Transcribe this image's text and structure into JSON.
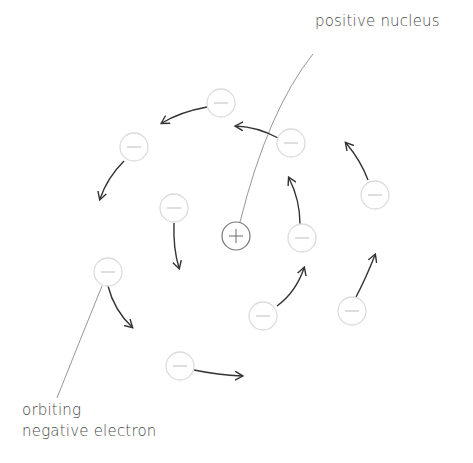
{
  "labels": {
    "nucleus": "positive nucleus",
    "electron_line1": "orbiting",
    "electron_line2": "negative electron"
  },
  "colors": {
    "electron_stroke": "#dcdcdc",
    "electron_sign": "#c8c8c8",
    "nucleus_stroke": "#777777",
    "arrow": "#333333",
    "leader_line": "#8a8a8a",
    "text": "#4a4a4a"
  },
  "nucleus": {
    "x": 236,
    "y": 236,
    "r": 14,
    "sign": "+"
  },
  "electrons": [
    {
      "x": 221,
      "y": 103,
      "r": 14,
      "sign": "-"
    },
    {
      "x": 291,
      "y": 143,
      "r": 14,
      "sign": "-"
    },
    {
      "x": 134,
      "y": 147,
      "r": 14,
      "sign": "-"
    },
    {
      "x": 375,
      "y": 195,
      "r": 14,
      "sign": "-"
    },
    {
      "x": 174,
      "y": 208,
      "r": 14,
      "sign": "-"
    },
    {
      "x": 302,
      "y": 238,
      "r": 14,
      "sign": "-"
    },
    {
      "x": 108,
      "y": 272,
      "r": 14,
      "sign": "-"
    },
    {
      "x": 352,
      "y": 311,
      "r": 14,
      "sign": "-"
    },
    {
      "x": 263,
      "y": 316,
      "r": 14,
      "sign": "-"
    },
    {
      "x": 180,
      "y": 366,
      "r": 14,
      "sign": "-"
    }
  ],
  "arrows": [
    {
      "d": "M207,107 Q180,112 162,123"
    },
    {
      "d": "M278,138 Q258,127 236,126"
    },
    {
      "d": "M124,161 Q107,178 100,199"
    },
    {
      "d": "M368,180 Q361,161 346,143"
    },
    {
      "d": "M174,223 Q173,248 179,268"
    },
    {
      "d": "M300,224 Q300,200 289,178"
    },
    {
      "d": "M108,286 Q114,310 132,327"
    },
    {
      "d": "M356,297 Q366,278 375,255"
    },
    {
      "d": "M277,306 Q296,292 304,268"
    },
    {
      "d": "M194,370 Q218,375 242,376"
    }
  ],
  "leaders": [
    {
      "d": "M313,54 Q268,110 240,222"
    },
    {
      "d": "M102,286 Q80,340 57,398"
    }
  ]
}
